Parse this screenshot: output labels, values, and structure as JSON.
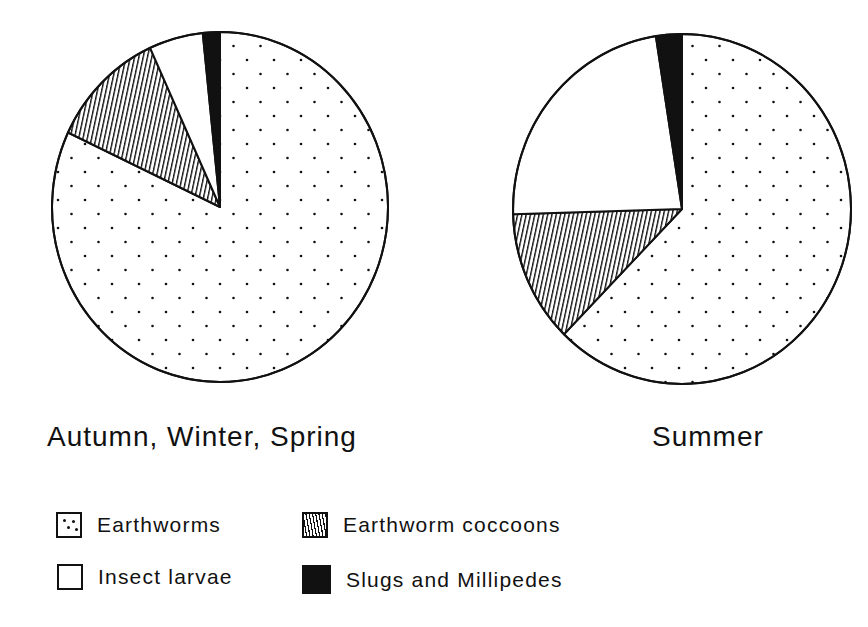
{
  "chart_data": [
    {
      "type": "pie",
      "title": "Autumn, Winter, Spring",
      "categories": [
        "Earthworms",
        "Earthworm coccoons",
        "Insect larvae",
        "Slugs and Millipedes"
      ],
      "values": [
        82,
        11,
        5,
        2
      ],
      "units": "percent (estimated from slice angles)",
      "start_angle": "12 o'clock, slices ordered counter-clockwise from top: Slugs and Millipedes, Insect larvae, Earthworm coccoons; Earthworms clockwise from top"
    },
    {
      "type": "pie",
      "title": "Summer",
      "categories": [
        "Earthworms",
        "Earthworm coccoons",
        "Insect larvae",
        "Slugs and Millipedes"
      ],
      "values": [
        62,
        12,
        23,
        3
      ],
      "units": "percent (estimated from slice angles)"
    }
  ],
  "pies": [
    {
      "title": "Autumn, Winter, Spring",
      "cx": 220,
      "cy": 207,
      "rx": 168,
      "ry": 175,
      "slices": [
        {
          "key": "earthworms",
          "start": 0,
          "end": 295.2
        },
        {
          "key": "coccoons",
          "start": 295.2,
          "end": 335.4
        },
        {
          "key": "larvae",
          "start": 335.4,
          "end": 354.1
        },
        {
          "key": "slugs",
          "start": 354.1,
          "end": 360
        }
      ]
    },
    {
      "title": "Summer",
      "cx": 682,
      "cy": 209,
      "rx": 169,
      "ry": 175,
      "slices": [
        {
          "key": "earthworms",
          "start": 0,
          "end": 224.3
        },
        {
          "key": "coccoons",
          "start": 224.3,
          "end": 268.3
        },
        {
          "key": "larvae",
          "start": 268.3,
          "end": 351.1
        },
        {
          "key": "slugs",
          "start": 351.1,
          "end": 360
        }
      ]
    }
  ],
  "legend": [
    {
      "key": "earthworms",
      "label": "Earthworms",
      "pattern": "dots"
    },
    {
      "key": "coccoons",
      "label": "Earthworm coccoons",
      "pattern": "hatch"
    },
    {
      "key": "larvae",
      "label": "Insect larvae",
      "pattern": "blank"
    },
    {
      "key": "slugs",
      "label": "Slugs and Millipedes",
      "pattern": "solid"
    }
  ],
  "colors": {
    "ink": "#111111",
    "paper": "#ffffff"
  }
}
